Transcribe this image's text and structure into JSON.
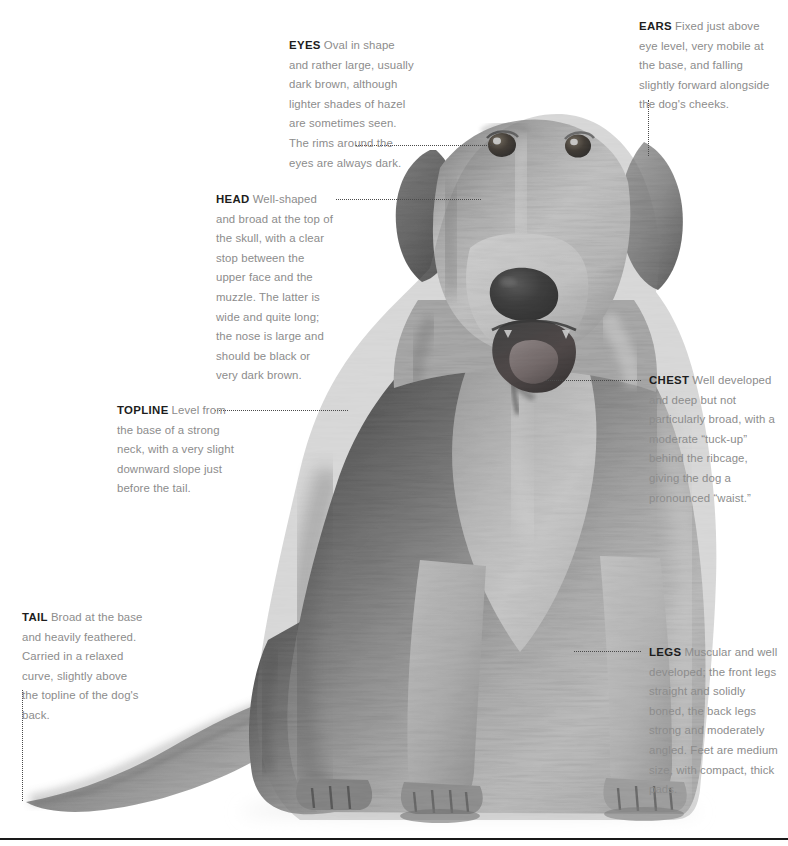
{
  "page": {
    "background_color": "#ffffff",
    "width": 788,
    "height": 846,
    "rule_color": "#1a1a1a"
  },
  "image": {
    "subject": "dog-photograph",
    "description": "Black and white photograph of a sitting golden retriever type dog facing forward with mouth open",
    "alt": "Sitting dog, front view"
  },
  "colors": {
    "term": "#1d1d1d",
    "body_text": "#8c8c8c",
    "leader": "#4a4a4a",
    "rule": "#1a1a1a"
  },
  "callouts": [
    {
      "id": "eyes",
      "term": "EYES",
      "text": "Oval in shape and rather large, usually dark brown, although lighter shades of hazel are sometimes seen. The rims around the eyes are always dark.",
      "leader": "horizontal"
    },
    {
      "id": "ears",
      "term": "EARS",
      "text": "Fixed just above eye level, very mobile at the base, and falling slightly forward alongside the dog's cheeks.",
      "leader": "vertical"
    },
    {
      "id": "head",
      "term": "HEAD",
      "text": "Well-shaped and broad at the top of the skull, with a clear stop between the upper face and the muzzle. The latter is wide and quite long; the nose is large and should be black or very dark brown.",
      "leader": "horizontal"
    },
    {
      "id": "chest",
      "term": "CHEST",
      "text": "Well developed and deep but not particularly broad, with a moderate “tuck-up” behind the ribcage, giving the dog a pronounced “waist.”",
      "leader": "horizontal"
    },
    {
      "id": "topline",
      "term": "TOPLINE",
      "text": "Level from the base of a strong neck, with a very slight downward slope just before the tail.",
      "leader": "horizontal"
    },
    {
      "id": "tail",
      "term": "TAIL",
      "text": "Broad at the base and heavily feathered. Carried in a relaxed curve, slightly above the topline of the dog's back.",
      "leader": "vertical"
    },
    {
      "id": "legs",
      "term": "LEGS",
      "text": "Muscular and well developed; the front legs straight and solidly boned, the back legs strong and moderately angled. Feet are medium size, with compact, thick pads.",
      "leader": "horizontal"
    }
  ]
}
